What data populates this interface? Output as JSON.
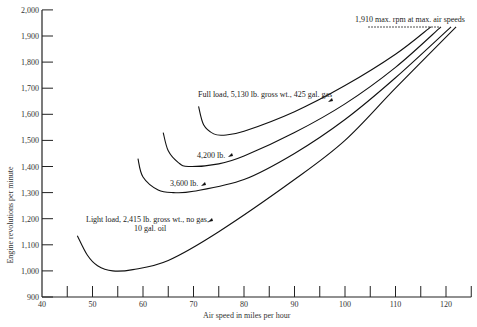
{
  "chart_data": {
    "type": "line",
    "title": "",
    "xlabel": "Air speed in miles per hour",
    "ylabel": "Engine revolutions per minute",
    "xlim": [
      40,
      125
    ],
    "ylim": [
      900,
      2000
    ],
    "x_ticks": [
      40,
      50,
      60,
      70,
      80,
      90,
      100,
      110,
      120
    ],
    "x_minor_ticks": [
      45,
      55,
      65,
      75,
      85,
      95,
      105,
      115,
      125
    ],
    "y_ticks": [
      900,
      1000,
      1100,
      1200,
      1300,
      1400,
      1500,
      1600,
      1700,
      1800,
      1900,
      2000
    ],
    "y_tick_labels": [
      "900",
      "1,000",
      "1,100",
      "1,200",
      "1,300",
      "1,400",
      "1,500",
      "1,600",
      "1,700",
      "1,800",
      "1,900",
      "2,000"
    ],
    "x_tick_labels": [
      "40",
      "50",
      "60",
      "70",
      "80",
      "90",
      "100",
      "110",
      "120"
    ],
    "grid": false,
    "series": [
      {
        "name": "Full load, 5,130 lb. gross wt., 425 gal. gas",
        "points": [
          [
            71,
            1630
          ],
          [
            72,
            1560
          ],
          [
            74,
            1525
          ],
          [
            76,
            1520
          ],
          [
            80,
            1535
          ],
          [
            90,
            1610
          ],
          [
            100,
            1710
          ],
          [
            110,
            1830
          ],
          [
            117,
            1935
          ]
        ]
      },
      {
        "name": "4,200 lb.",
        "points": [
          [
            64,
            1530
          ],
          [
            65,
            1460
          ],
          [
            67,
            1415
          ],
          [
            69,
            1400
          ],
          [
            75,
            1410
          ],
          [
            80,
            1440
          ],
          [
            90,
            1530
          ],
          [
            100,
            1640
          ],
          [
            110,
            1780
          ],
          [
            119,
            1935
          ]
        ]
      },
      {
        "name": "3,600 lb.",
        "points": [
          [
            59,
            1430
          ],
          [
            60,
            1360
          ],
          [
            63,
            1310
          ],
          [
            66,
            1300
          ],
          [
            70,
            1305
          ],
          [
            80,
            1350
          ],
          [
            90,
            1450
          ],
          [
            100,
            1580
          ],
          [
            110,
            1740
          ],
          [
            121,
            1935
          ]
        ]
      },
      {
        "name": "Light load, 2,415 lb. gross wt., no gas, 10 gal. oil",
        "points": [
          [
            47,
            1135
          ],
          [
            49,
            1060
          ],
          [
            51,
            1020
          ],
          [
            54,
            1000
          ],
          [
            58,
            1005
          ],
          [
            65,
            1040
          ],
          [
            75,
            1150
          ],
          [
            90,
            1350
          ],
          [
            100,
            1500
          ],
          [
            110,
            1700
          ],
          [
            122,
            1935
          ]
        ]
      }
    ],
    "annotations": [
      {
        "text": "1,910 max. rpm at max. air speeds",
        "x": 112,
        "y": 1940
      },
      {
        "text": "Full load, 5,130 lb. gross wt., 425 gal. gas",
        "x": 84,
        "y": 1620
      },
      {
        "text": "4,200 lb.",
        "x": 75,
        "y": 1450
      },
      {
        "text": "3,600 lb.",
        "x": 68,
        "y": 1350
      },
      {
        "text": "Light load, 2,415 lb. gross wt., no gas,",
        "x": 70,
        "y": 1190
      },
      {
        "text": "10 gal. oil",
        "x": 75,
        "y": 1155
      }
    ],
    "legend_position": "none"
  },
  "labels": {
    "xlabel": "Air speed in miles per hour",
    "ylabel": "Engine revolutions per minute",
    "max_rpm": "1,910 max. rpm at max. air speeds",
    "full_load": "Full load, 5,130 lb. gross wt., 425 gal. gas",
    "w4200": "4,200 lb.",
    "w3600": "3,600 lb.",
    "light1": "Light load, 2,415 lb. gross wt., no gas,",
    "light2": "10 gal. oil"
  }
}
